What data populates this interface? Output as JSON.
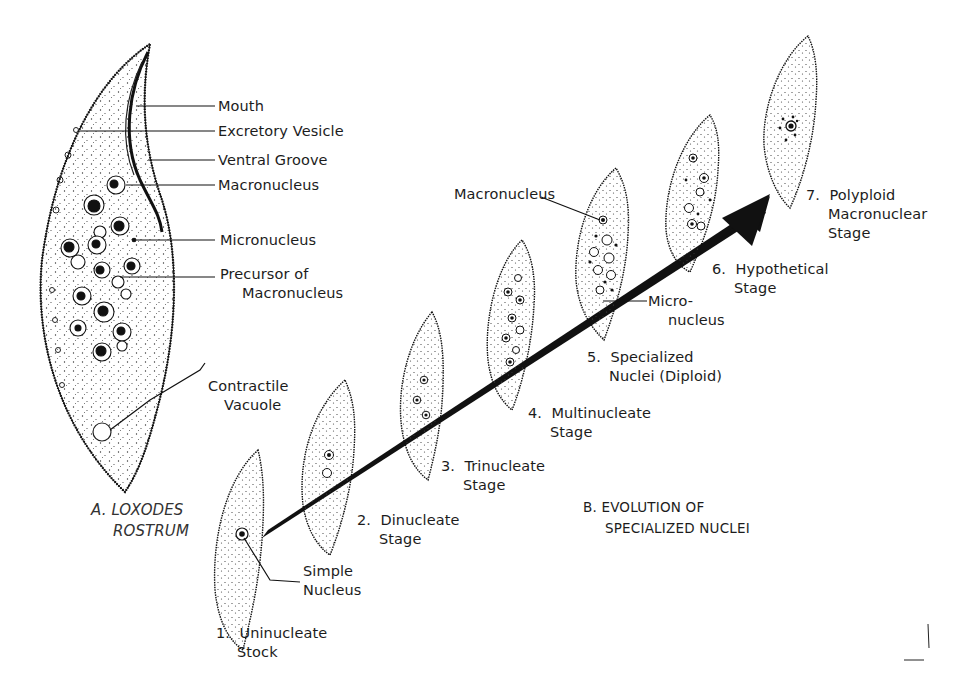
{
  "figure": {
    "part_a": {
      "title_line1": "A. LOXODES",
      "title_line2": "ROSTRUM",
      "labels": {
        "mouth": "Mouth",
        "excretory_vesicle": "Excretory Vesicle",
        "ventral_groove": "Ventral Groove",
        "macronucleus": "Macronucleus",
        "micronucleus": "Micronucleus",
        "precursor_line1": "Precursor of",
        "precursor_line2": "Macronucleus",
        "contractile_line1": "Contractile",
        "contractile_line2": "Vacuole"
      }
    },
    "part_b": {
      "title_line1": "B.  EVOLUTION OF",
      "title_line2": "SPECIALIZED NUCLEI",
      "stages": [
        {
          "number": "1.",
          "line1": "Uninucleate",
          "line2": "Stock"
        },
        {
          "number": "2.",
          "line1": "Dinucleate",
          "line2": "Stage"
        },
        {
          "number": "3.",
          "line1": "Trinucleate",
          "line2": "Stage"
        },
        {
          "number": "4.",
          "line1": "Multinucleate",
          "line2": "Stage"
        },
        {
          "number": "5.",
          "line1": "Specialized",
          "line2": "Nuclei (Diploid)"
        },
        {
          "number": "6.",
          "line1": "Hypothetical",
          "line2": "Stage"
        },
        {
          "number": "7.",
          "line1": "Polyploid",
          "line2": "Macronuclear",
          "line3": "Stage"
        }
      ],
      "callouts": {
        "simple_nucleus_line1": "Simple",
        "simple_nucleus_line2": "Nucleus",
        "macronucleus": "Macronucleus",
        "micronucleus_line1": "Micro-",
        "micronucleus_line2": "nucleus"
      }
    },
    "colors": {
      "ink": "#1a1a1a",
      "paper": "#ffffff",
      "italic_title": "#333333"
    }
  }
}
